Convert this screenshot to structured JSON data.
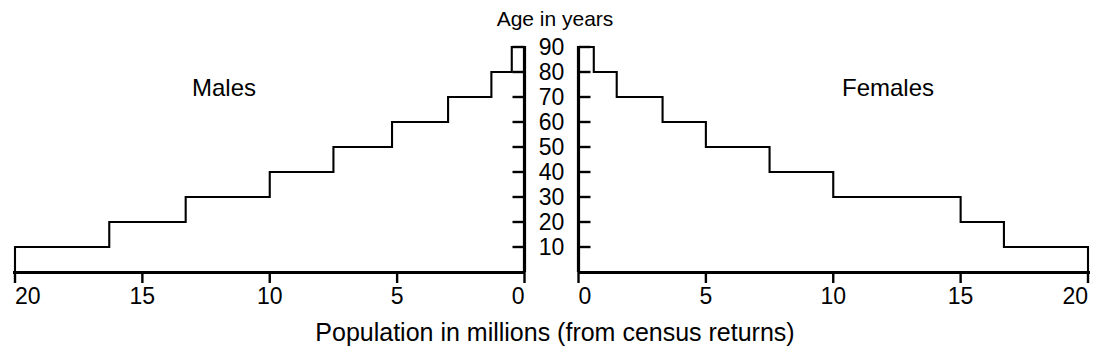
{
  "figure": {
    "title_top": "Age in years",
    "caption_bottom": "Population in millions (from census returns)",
    "left_series_label": "Males",
    "right_series_label": "Females",
    "ink_color": "#000000",
    "background_color": "#ffffff"
  },
  "chart_data": {
    "type": "bar",
    "subtype": "population-pyramid",
    "title": "Population in millions (from census returns)",
    "xlabel": "Population in millions (from census returns)",
    "ylabel": "Age in years",
    "orientation": "horizontal",
    "categories": [
      "0-10",
      "10-20",
      "20-30",
      "30-40",
      "40-50",
      "50-60",
      "60-70",
      "70-80",
      "80-90"
    ],
    "y_tick_labels": [
      "10",
      "20",
      "30",
      "40",
      "50",
      "60",
      "70",
      "80",
      "90"
    ],
    "y_tick_values": [
      10,
      20,
      30,
      40,
      50,
      60,
      70,
      80,
      90
    ],
    "ylim": [
      0,
      90
    ],
    "left_axis": {
      "label": "Males",
      "tick_labels": [
        "20",
        "15",
        "10",
        "5",
        "0"
      ],
      "tick_values": [
        20,
        15,
        10,
        5,
        0
      ],
      "xlim": [
        20,
        0
      ],
      "direction": "reversed"
    },
    "right_axis": {
      "label": "Females",
      "tick_labels": [
        "0",
        "5",
        "10",
        "15",
        "20"
      ],
      "tick_values": [
        0,
        5,
        10,
        15,
        20
      ],
      "xlim": [
        0,
        20
      ],
      "direction": "normal"
    },
    "grid": false,
    "legend": "none",
    "units": "millions",
    "series": [
      {
        "name": "Males",
        "side": "left",
        "values": [
          20.0,
          16.3,
          13.3,
          10.0,
          7.5,
          5.2,
          3.0,
          1.3,
          0.5
        ]
      },
      {
        "name": "Females",
        "side": "right",
        "values": [
          20.0,
          16.7,
          15.0,
          10.0,
          7.5,
          5.0,
          3.3,
          1.5,
          0.6
        ]
      }
    ]
  }
}
